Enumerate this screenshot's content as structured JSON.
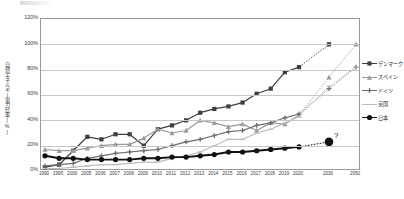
{
  "chart_data": {
    "type": "line",
    "title": "",
    "xlabel": "",
    "ylabel": "自然エネルギー電力比率(%)",
    "ylim": [
      0,
      120
    ],
    "yticks": [
      "0%",
      "20%",
      "40%",
      "60%",
      "80%",
      "100%",
      "120%"
    ],
    "ytick_values": [
      0,
      20,
      40,
      60,
      80,
      100,
      120
    ],
    "grid": true,
    "legend_position": "right",
    "categories": [
      "1990",
      "1995",
      "2000",
      "2005",
      "2006",
      "2007",
      "2008",
      "2009",
      "2010",
      "2011",
      "2012",
      "2013",
      "2014",
      "2015",
      "2016",
      "2017",
      "2018",
      "2019",
      "2020",
      "2030",
      "2050"
    ],
    "series": [
      {
        "name": "デンマーク",
        "marker": "square",
        "color": "#3f3f3f",
        "values": [
          3,
          5,
          16,
          27,
          25,
          29,
          29,
          20,
          33,
          36,
          40,
          46,
          49,
          51,
          54,
          61,
          65,
          78,
          82,
          100,
          null
        ],
        "projection_from": "2020",
        "projection_to": "2030",
        "projection_value": 100
      },
      {
        "name": "スペイン",
        "marker": "triangle",
        "color": "#9b9b9b",
        "values": [
          17,
          16,
          16,
          18,
          20,
          21,
          21,
          26,
          33,
          30,
          32,
          40,
          38,
          35,
          37,
          32,
          38,
          37,
          44,
          74,
          100
        ],
        "projection_from": "2020",
        "projection_to": "2050",
        "projection_value": 100
      },
      {
        "name": "ドイツ",
        "marker": "cross",
        "color": "#6e6e6e",
        "values": [
          4,
          5,
          6,
          10,
          12,
          14,
          15,
          16,
          17,
          20,
          23,
          25,
          28,
          31,
          32,
          36,
          38,
          42,
          45,
          65,
          82
        ],
        "projection_from": "2020",
        "projection_to": "2050",
        "projection_value": 82
      },
      {
        "name": "英国",
        "marker": "dash",
        "color": "#bdbdbd",
        "values": [
          2,
          2,
          3,
          4,
          5,
          5,
          6,
          7,
          7,
          10,
          12,
          15,
          20,
          25,
          25,
          30,
          33,
          38,
          43,
          67,
          82
        ],
        "projection_from": "2020",
        "projection_to": "2050",
        "projection_value": 82
      },
      {
        "name": "日本",
        "marker": "circle",
        "color": "#111111",
        "values": [
          12,
          10,
          10,
          9,
          9,
          9,
          9,
          10,
          10,
          11,
          11,
          12,
          13,
          15,
          15,
          16,
          17,
          18,
          19,
          23,
          null
        ],
        "projection_from": "2020",
        "projection_to": "2030",
        "projection_value": 23,
        "annotation": "?"
      }
    ],
    "annotations": [
      {
        "text": "?",
        "x": "2030",
        "y": 23
      }
    ]
  },
  "legend": {
    "items": [
      {
        "label": "デンマーク"
      },
      {
        "label": "スペイン"
      },
      {
        "label": "ドイツ"
      },
      {
        "label": "英国"
      },
      {
        "label": "日本"
      }
    ]
  }
}
